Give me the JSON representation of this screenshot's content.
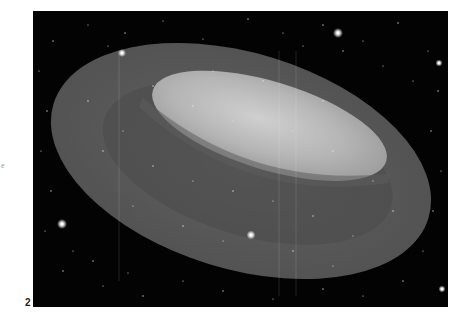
{
  "figure": {
    "number": "2",
    "margin_fragment": "e",
    "colors": {
      "background": "#030303",
      "torus_outer": "#5a5a5a",
      "torus_inner_shadow": "#4a4a4a",
      "hole_highlight": "#bdbdbd",
      "page": "#ffffff"
    }
  }
}
